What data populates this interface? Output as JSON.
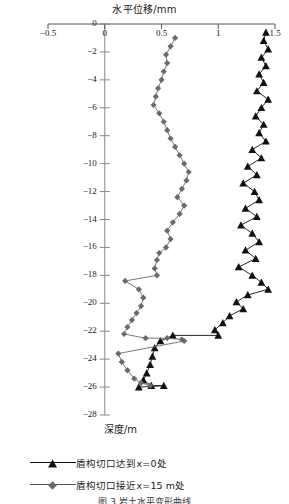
{
  "chart_data": {
    "type": "line",
    "title": "水平位移/mm",
    "xlabel": "水平位移/mm",
    "ylabel": "深度/m",
    "orientation": "depth-profile",
    "xlim": [
      -0.5,
      1.5
    ],
    "ylim": [
      -28,
      0
    ],
    "xticks": [
      -0.5,
      0,
      0.5,
      1,
      1.5
    ],
    "xticklabels": [
      "−0.5",
      "0",
      "0.5",
      "1",
      "1.5"
    ],
    "yticks": [
      0,
      -2,
      -4,
      -6,
      -8,
      -10,
      -12,
      -14,
      -16,
      -18,
      -20,
      -22,
      -24,
      -26,
      -28
    ],
    "yticklabels": [
      "0",
      "−2",
      "−4",
      "−6",
      "−8",
      "−10",
      "−12",
      "−14",
      "−16",
      "−18",
      "−20",
      "−22",
      "−24",
      "−26",
      "−28"
    ],
    "grid": false,
    "legend_position": "below",
    "series": [
      {
        "name": "盾构切口达到x=0处",
        "marker": "triangle",
        "color": "#111111",
        "points": [
          [
            1.42,
            -0.6
          ],
          [
            1.4,
            -1.2
          ],
          [
            1.44,
            -1.8
          ],
          [
            1.38,
            -2.4
          ],
          [
            1.42,
            -3.0
          ],
          [
            1.36,
            -3.6
          ],
          [
            1.4,
            -4.2
          ],
          [
            1.34,
            -4.8
          ],
          [
            1.44,
            -5.4
          ],
          [
            1.38,
            -6.0
          ],
          [
            1.33,
            -6.6
          ],
          [
            1.4,
            -7.2
          ],
          [
            1.36,
            -7.8
          ],
          [
            1.42,
            -8.4
          ],
          [
            1.3,
            -9.0
          ],
          [
            1.38,
            -9.6
          ],
          [
            1.26,
            -10.2
          ],
          [
            1.34,
            -10.8
          ],
          [
            1.22,
            -11.4
          ],
          [
            1.32,
            -12.0
          ],
          [
            1.36,
            -12.6
          ],
          [
            1.24,
            -13.2
          ],
          [
            1.34,
            -13.8
          ],
          [
            1.2,
            -14.4
          ],
          [
            1.3,
            -15.0
          ],
          [
            1.36,
            -15.6
          ],
          [
            1.24,
            -16.2
          ],
          [
            1.33,
            -16.8
          ],
          [
            1.18,
            -17.4
          ],
          [
            1.3,
            -18.0
          ],
          [
            1.38,
            -18.5
          ],
          [
            1.44,
            -19.0
          ],
          [
            1.26,
            -19.4
          ],
          [
            1.16,
            -19.9
          ],
          [
            1.22,
            -20.4
          ],
          [
            1.1,
            -20.9
          ],
          [
            1.04,
            -21.4
          ],
          [
            0.97,
            -21.9
          ],
          [
            1.0,
            -22.3
          ],
          [
            0.6,
            -22.3
          ],
          [
            0.49,
            -22.7
          ],
          [
            0.44,
            -23.2
          ],
          [
            0.42,
            -23.8
          ],
          [
            0.4,
            -24.4
          ],
          [
            0.37,
            -25.0
          ],
          [
            0.34,
            -25.5
          ],
          [
            0.41,
            -25.9
          ],
          [
            0.52,
            -25.9
          ],
          [
            0.3,
            -26.0
          ]
        ]
      },
      {
        "name": "盾构切口接近x=15 m处",
        "marker": "diamond",
        "color": "#6a6a6a",
        "points": [
          [
            0.62,
            -1.0
          ],
          [
            0.58,
            -1.6
          ],
          [
            0.54,
            -2.2
          ],
          [
            0.55,
            -2.8
          ],
          [
            0.52,
            -3.4
          ],
          [
            0.5,
            -4.0
          ],
          [
            0.47,
            -4.6
          ],
          [
            0.45,
            -5.2
          ],
          [
            0.43,
            -5.8
          ],
          [
            0.48,
            -6.4
          ],
          [
            0.52,
            -7.0
          ],
          [
            0.55,
            -7.6
          ],
          [
            0.58,
            -8.2
          ],
          [
            0.62,
            -8.8
          ],
          [
            0.66,
            -9.4
          ],
          [
            0.7,
            -10.0
          ],
          [
            0.74,
            -10.6
          ],
          [
            0.72,
            -11.2
          ],
          [
            0.68,
            -11.8
          ],
          [
            0.64,
            -12.4
          ],
          [
            0.7,
            -13.0
          ],
          [
            0.66,
            -13.6
          ],
          [
            0.6,
            -14.2
          ],
          [
            0.55,
            -14.8
          ],
          [
            0.58,
            -15.4
          ],
          [
            0.54,
            -16.0
          ],
          [
            0.48,
            -16.4
          ],
          [
            0.46,
            -16.9
          ],
          [
            0.44,
            -17.5
          ],
          [
            0.46,
            -18.0
          ],
          [
            0.18,
            -18.4
          ],
          [
            0.3,
            -19.0
          ],
          [
            0.34,
            -19.6
          ],
          [
            0.32,
            -20.2
          ],
          [
            0.28,
            -20.7
          ],
          [
            0.24,
            -21.2
          ],
          [
            0.2,
            -21.7
          ],
          [
            0.17,
            -22.2
          ],
          [
            0.36,
            -22.5
          ],
          [
            0.55,
            -22.5
          ],
          [
            0.68,
            -22.6
          ],
          [
            0.7,
            -22.7
          ],
          [
            0.12,
            -23.6
          ],
          [
            0.15,
            -24.2
          ],
          [
            0.2,
            -24.8
          ],
          [
            0.26,
            -25.4
          ],
          [
            0.32,
            -25.7
          ],
          [
            0.4,
            -25.9
          ]
        ]
      }
    ]
  },
  "axes": {
    "x_tick_labels": [
      "−0.5",
      "0",
      "0.5",
      "1",
      "1.5"
    ],
    "y_tick_labels": [
      "0",
      "−2",
      "−4",
      "−6",
      "−8",
      "−10",
      "−12",
      "−14",
      "−16",
      "−18",
      "−20",
      "−22",
      "−24",
      "−26",
      "−28"
    ],
    "top_axis_title": "水平位移/mm",
    "vertical_axis_title": "深度/m"
  },
  "legend": {
    "items": [
      {
        "label": "盾构切口达到x=0处",
        "marker": "triangle-marker",
        "color": "#111111"
      },
      {
        "label": "盾构切口接近x=15 m处",
        "marker": "diamond-marker",
        "color": "#6a6a6a"
      }
    ]
  },
  "caption": {
    "text": "图 3  岩土水平变形曲线"
  }
}
